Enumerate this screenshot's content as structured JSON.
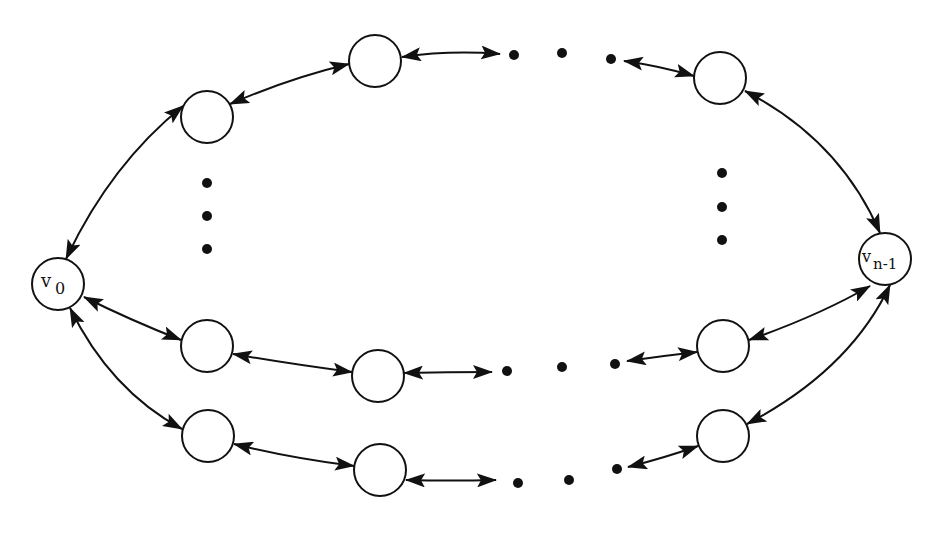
{
  "diagram": {
    "type": "bidirectional ring network",
    "colors": {
      "stroke": "#111111",
      "background": "#ffffff",
      "node_fill": "#ffffff"
    },
    "nodes": [
      {
        "id": "v0",
        "label": "v",
        "subscript": "0",
        "x": 58,
        "y": 284
      },
      {
        "id": "vn1",
        "label": "v",
        "subscript": "n-1",
        "x": 885,
        "y": 259
      },
      {
        "id": "top-left",
        "label": "",
        "x": 207,
        "y": 117
      },
      {
        "id": "top-mid",
        "label": "",
        "x": 375,
        "y": 61
      },
      {
        "id": "top-right",
        "label": "",
        "x": 720,
        "y": 78
      },
      {
        "id": "mid-left",
        "label": "",
        "x": 207,
        "y": 346
      },
      {
        "id": "mid-center",
        "label": "",
        "x": 378,
        "y": 376
      },
      {
        "id": "mid-right",
        "label": "",
        "x": 723,
        "y": 346
      },
      {
        "id": "bot-left",
        "label": "",
        "x": 208,
        "y": 436
      },
      {
        "id": "bot-center",
        "label": "",
        "x": 380,
        "y": 470
      },
      {
        "id": "bot-right",
        "label": "",
        "x": 723,
        "y": 436
      }
    ],
    "edges": [
      {
        "from": "v0",
        "to": "top-left",
        "bidirectional": true
      },
      {
        "from": "top-left",
        "to": "top-mid",
        "bidirectional": true
      },
      {
        "from": "top-mid",
        "to": "ellipsis-top",
        "bidirectional": true
      },
      {
        "from": "ellipsis-top",
        "to": "top-right",
        "bidirectional": true
      },
      {
        "from": "top-right",
        "to": "vn1",
        "bidirectional": true
      },
      {
        "from": "v0",
        "to": "mid-left",
        "bidirectional": true
      },
      {
        "from": "mid-left",
        "to": "mid-center",
        "bidirectional": true
      },
      {
        "from": "mid-center",
        "to": "ellipsis-mid",
        "bidirectional": true
      },
      {
        "from": "ellipsis-mid",
        "to": "mid-right",
        "bidirectional": true
      },
      {
        "from": "mid-right",
        "to": "vn1",
        "bidirectional": true
      },
      {
        "from": "v0",
        "to": "bot-left",
        "bidirectional": true
      },
      {
        "from": "bot-left",
        "to": "bot-center",
        "bidirectional": true
      },
      {
        "from": "bot-center",
        "to": "ellipsis-bot",
        "bidirectional": true
      },
      {
        "from": "ellipsis-bot",
        "to": "bot-right",
        "bidirectional": true
      },
      {
        "from": "bot-right",
        "to": "vn1",
        "bidirectional": true
      }
    ],
    "ellipses": [
      {
        "id": "ellipsis-top",
        "orientation": "horizontal",
        "count": 3
      },
      {
        "id": "ellipsis-left-vertical",
        "orientation": "vertical",
        "count": 3
      },
      {
        "id": "ellipsis-right-vertical",
        "orientation": "vertical",
        "count": 3
      },
      {
        "id": "ellipsis-mid",
        "orientation": "horizontal",
        "count": 3
      },
      {
        "id": "ellipsis-bot",
        "orientation": "horizontal",
        "count": 3
      }
    ],
    "labels": {
      "v0_main": "v",
      "v0_sub": "0",
      "vn1_main": "v",
      "vn1_sub": "n-1"
    }
  }
}
